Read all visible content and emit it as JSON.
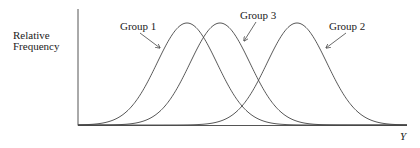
{
  "chart_data": {
    "type": "line",
    "title": "",
    "xlabel": "Y",
    "ylabel": "Relative Frequency",
    "grid": false,
    "legend": "none (series labeled with arrows)",
    "axis_ticks": false,
    "x": [
      0,
      1,
      2,
      3,
      4,
      5,
      6,
      7,
      8,
      9,
      10
    ],
    "series": [
      {
        "name": "Group 1",
        "shape": "normal",
        "mean": 3.3,
        "sd": 0.9,
        "relative_peak": 1.0
      },
      {
        "name": "Group 3",
        "shape": "normal",
        "mean": 4.3,
        "sd": 0.9,
        "relative_peak": 1.0
      },
      {
        "name": "Group 2",
        "shape": "normal",
        "mean": 6.6,
        "sd": 0.9,
        "relative_peak": 1.0
      }
    ]
  },
  "labels": {
    "ylabel_line1": "Relative",
    "ylabel_line2": "Frequency",
    "xlabel": "Y",
    "group1": "Group 1",
    "group2": "Group 2",
    "group3": "Group 3"
  },
  "plot": {
    "origin_x": 78,
    "origin_y": 125,
    "axis_top": 9,
    "axis_right": 407,
    "peak_height": 102,
    "sigma_px": 30,
    "means_px": {
      "group1": 187,
      "group3": 220,
      "group2": 297
    },
    "line_color": "#444444"
  }
}
